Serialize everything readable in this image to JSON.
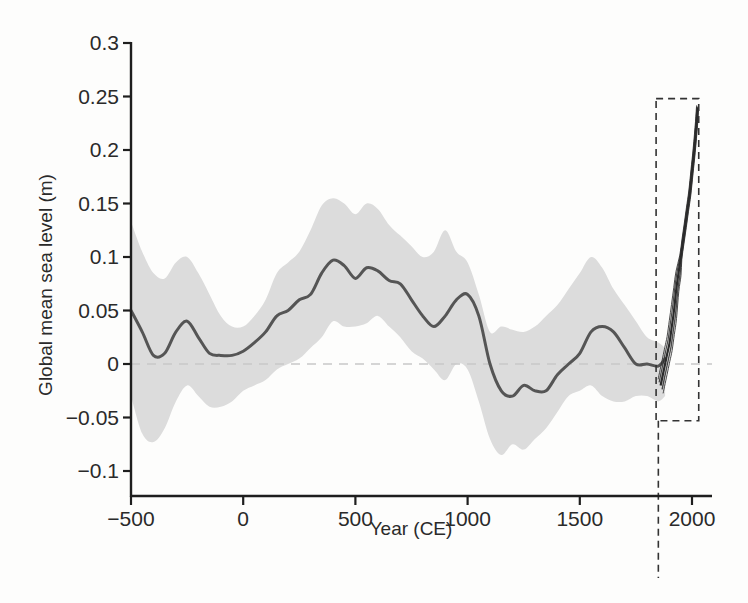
{
  "chart_data": {
    "type": "line",
    "title": "",
    "xlabel": "Year (CE)",
    "ylabel": "Global mean sea level (m)",
    "xlim": [
      -500,
      2100
    ],
    "ylim": [
      -0.115,
      0.3
    ],
    "grid": false,
    "legend": null,
    "x_ticks": [
      -500,
      0,
      500,
      1000,
      1500,
      2000
    ],
    "x_tick_labels": [
      "−500",
      "0",
      "500",
      "1000",
      "1500",
      "2000"
    ],
    "y_ticks": [
      0.3,
      0.25,
      0.2,
      0.15,
      0.1,
      0.05,
      0,
      -0.05,
      -0.1
    ],
    "y_tick_labels": [
      "0.3",
      "0.25",
      "0.2",
      "0.15",
      "0.1",
      "0.05",
      "0",
      "−0.05",
      "−0.1"
    ],
    "reference_line": {
      "y": 0,
      "style": "dashed",
      "color": "#c8c8c8"
    },
    "annotations": [
      {
        "type": "dashed-vertical-line",
        "x": 1850
      },
      {
        "type": "dashed-box",
        "x_range": [
          1840,
          2030
        ],
        "y_range": [
          -0.053,
          0.248
        ],
        "note": "instrumental-era zoom region"
      }
    ],
    "series": [
      {
        "name": "Reconstruction (central estimate)",
        "color": "#555555",
        "x": [
          -500,
          -450,
          -400,
          -350,
          -300,
          -250,
          -200,
          -150,
          -100,
          -50,
          0,
          50,
          100,
          150,
          200,
          250,
          300,
          350,
          400,
          450,
          500,
          550,
          600,
          650,
          700,
          750,
          800,
          850,
          900,
          950,
          1000,
          1050,
          1100,
          1150,
          1200,
          1250,
          1300,
          1350,
          1400,
          1450,
          1500,
          1550,
          1600,
          1650,
          1700,
          1750,
          1800,
          1850,
          1880
        ],
        "values": [
          0.05,
          0.03,
          0.008,
          0.01,
          0.03,
          0.04,
          0.025,
          0.01,
          0.008,
          0.008,
          0.012,
          0.02,
          0.03,
          0.045,
          0.05,
          0.06,
          0.065,
          0.085,
          0.097,
          0.092,
          0.08,
          0.09,
          0.087,
          0.078,
          0.075,
          0.06,
          0.045,
          0.035,
          0.045,
          0.06,
          0.065,
          0.045,
          0.0,
          -0.025,
          -0.03,
          -0.02,
          -0.025,
          -0.025,
          -0.01,
          0.0,
          0.01,
          0.03,
          0.035,
          0.03,
          0.015,
          0.0,
          0.0,
          -0.002,
          0.005
        ]
      },
      {
        "name": "Upper uncertainty bound",
        "color": "#dcdcdc",
        "x": [
          -500,
          -450,
          -400,
          -350,
          -300,
          -250,
          -200,
          -150,
          -100,
          -50,
          0,
          50,
          100,
          150,
          200,
          250,
          300,
          350,
          400,
          450,
          500,
          550,
          600,
          650,
          700,
          750,
          800,
          850,
          900,
          950,
          1000,
          1050,
          1100,
          1150,
          1200,
          1250,
          1300,
          1350,
          1400,
          1450,
          1500,
          1550,
          1600,
          1650,
          1700,
          1750,
          1800,
          1850,
          1880
        ],
        "values": [
          0.133,
          0.105,
          0.085,
          0.08,
          0.095,
          0.1,
          0.085,
          0.065,
          0.045,
          0.035,
          0.035,
          0.045,
          0.06,
          0.085,
          0.095,
          0.105,
          0.125,
          0.148,
          0.155,
          0.15,
          0.14,
          0.15,
          0.145,
          0.13,
          0.12,
          0.11,
          0.1,
          0.105,
          0.125,
          0.105,
          0.095,
          0.065,
          0.03,
          0.035,
          0.032,
          0.03,
          0.035,
          0.045,
          0.055,
          0.07,
          0.085,
          0.1,
          0.09,
          0.07,
          0.055,
          0.04,
          0.025,
          0.02,
          0.015
        ]
      },
      {
        "name": "Lower uncertainty bound",
        "color": "#dcdcdc",
        "x": [
          -500,
          -450,
          -400,
          -350,
          -300,
          -250,
          -200,
          -150,
          -100,
          -50,
          0,
          50,
          100,
          150,
          200,
          250,
          300,
          350,
          400,
          450,
          500,
          550,
          600,
          650,
          700,
          750,
          800,
          850,
          900,
          950,
          1000,
          1050,
          1100,
          1150,
          1200,
          1250,
          1300,
          1350,
          1400,
          1450,
          1500,
          1550,
          1600,
          1650,
          1700,
          1750,
          1800,
          1850,
          1880
        ],
        "values": [
          -0.03,
          -0.065,
          -0.073,
          -0.06,
          -0.035,
          -0.02,
          -0.03,
          -0.04,
          -0.04,
          -0.035,
          -0.025,
          -0.02,
          -0.015,
          -0.005,
          0.0,
          0.005,
          0.015,
          0.025,
          0.04,
          0.035,
          0.035,
          0.038,
          0.045,
          0.035,
          0.025,
          0.012,
          0.005,
          -0.005,
          -0.015,
          0.0,
          -0.005,
          -0.035,
          -0.07,
          -0.085,
          -0.075,
          -0.08,
          -0.07,
          -0.06,
          -0.045,
          -0.03,
          -0.025,
          -0.02,
          -0.03,
          -0.035,
          -0.035,
          -0.03,
          -0.03,
          -0.035,
          -0.03
        ]
      },
      {
        "name": "Tide-gauge / instrumental records",
        "color": "#2b2b2b",
        "x": [
          1860,
          1880,
          1890,
          1900,
          1910,
          1920,
          1930,
          1940,
          1950,
          1960,
          1970,
          1980,
          1990,
          2000,
          2010,
          2020,
          2025
        ],
        "values": [
          -0.02,
          0.0,
          0.01,
          0.02,
          0.035,
          0.05,
          0.07,
          0.085,
          0.1,
          0.115,
          0.13,
          0.145,
          0.16,
          0.18,
          0.2,
          0.225,
          0.24
        ]
      }
    ]
  }
}
